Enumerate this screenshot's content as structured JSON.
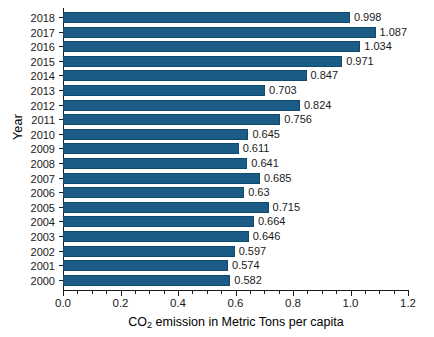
{
  "chart_data": {
    "type": "bar",
    "orientation": "horizontal",
    "title": "",
    "xlabel": "CO2 emission in Metric Tons per capita",
    "xlabel_prefix": "CO",
    "xlabel_subscript": "2",
    "xlabel_suffix": " emission in Metric Tons per capita",
    "ylabel": "Year",
    "categories": [
      "2000",
      "2001",
      "2002",
      "2003",
      "2004",
      "2005",
      "2006",
      "2007",
      "2008",
      "2009",
      "2010",
      "2011",
      "2012",
      "2013",
      "2014",
      "2015",
      "2016",
      "2017",
      "2018"
    ],
    "values": [
      0.582,
      0.574,
      0.597,
      0.646,
      0.664,
      0.715,
      0.63,
      0.685,
      0.641,
      0.611,
      0.645,
      0.756,
      0.824,
      0.703,
      0.847,
      0.971,
      1.034,
      1.087,
      0.998
    ],
    "value_labels": [
      "0.582",
      "0.574",
      "0.597",
      "0.646",
      "0.664",
      "0.715",
      "0.63",
      "0.685",
      "0.641",
      "0.611",
      "0.645",
      "0.756",
      "0.824",
      "0.703",
      "0.847",
      "0.971",
      "1.034",
      "1.087",
      "0.998"
    ],
    "xlim": [
      0.0,
      1.2
    ],
    "x_tick_labels": [
      "0.0",
      "0.2",
      "0.4",
      "0.6",
      "0.8",
      "1.0",
      "1.2"
    ],
    "x_tick_values": [
      0.0,
      0.2,
      0.4,
      0.6,
      0.8,
      1.0,
      1.2
    ],
    "x_minor_tick_step": 0.05,
    "grid": false,
    "legend": false,
    "bar_color": "#1a5c86",
    "bar_edge_color": "#12486b",
    "background_color": "#ffffff",
    "axis_color": "#1b1b1b"
  }
}
